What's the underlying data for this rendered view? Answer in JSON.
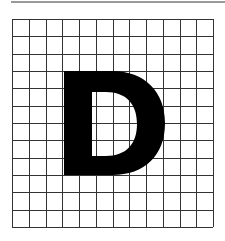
{
  "figure": {
    "letter": "D",
    "grid": {
      "columns": 12,
      "rows": 12
    },
    "colors": {
      "letter": "#000000",
      "grid_line": "#333333",
      "background": "#ffffff",
      "top_rule": "#9a9a9a"
    }
  }
}
